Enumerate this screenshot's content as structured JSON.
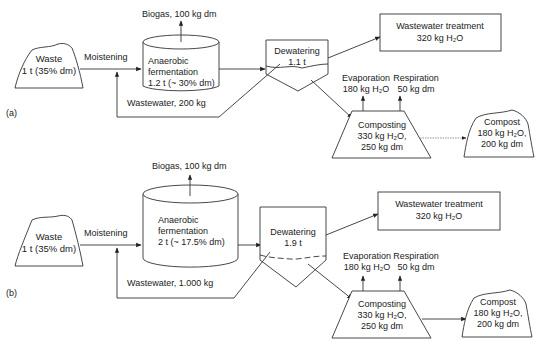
{
  "panels": [
    {
      "id": "a",
      "label": "(a)",
      "waste": {
        "title": "Waste",
        "amount": "1 t (35% dm)"
      },
      "moistening": "Moistening",
      "biogas": "Biogas, 100 kg dm",
      "fermentation": {
        "line1": "Anaerobic",
        "line2": "fermentation",
        "line3": "1.2 t (~ 30% dm)"
      },
      "dewatering": {
        "title": "Dewatering",
        "amount": "1.1 t"
      },
      "wastewater_recycle": "Wastewater, 200 kg",
      "wastewater_treatment": {
        "title": "Wastewater treatment",
        "amount": "320 kg H₂O"
      },
      "evaporation": {
        "title": "Evaporation",
        "amount": "180 kg H₂O"
      },
      "respiration": {
        "title": "Respiration",
        "amount": "50 kg dm"
      },
      "composting": {
        "title": "Composting",
        "line2": "330 kg H₂O,",
        "line3": "250 kg dm"
      },
      "compost": {
        "title": "Compost",
        "line2": "180 kg H₂O,",
        "line3": "200 kg dm"
      }
    },
    {
      "id": "b",
      "label": "(b)",
      "waste": {
        "title": "Waste",
        "amount": "1 t (35% dm)"
      },
      "moistening": "Moistening",
      "biogas": "Biogas, 100 kg dm",
      "fermentation": {
        "line1": "Anaerobic",
        "line2": "fermentation",
        "line3": "2 t (~ 17.5% dm)"
      },
      "dewatering": {
        "title": "Dewatering",
        "amount": "1.9 t"
      },
      "wastewater_recycle": "Wastewater, 1.000 kg",
      "wastewater_treatment": {
        "title": "Wastewater treatment",
        "amount": "320 kg H₂O"
      },
      "evaporation": {
        "title": "Evaporation",
        "amount": "180 kg H₂O"
      },
      "respiration": {
        "title": "Respiration",
        "amount": "50 kg dm"
      },
      "composting": {
        "title": "Composting",
        "line2": "330 kg H₂O,",
        "line3": "250 kg dm"
      },
      "compost": {
        "title": "Compost",
        "line2": "180 kg H₂O,",
        "line3": "200 kg dm"
      }
    }
  ]
}
